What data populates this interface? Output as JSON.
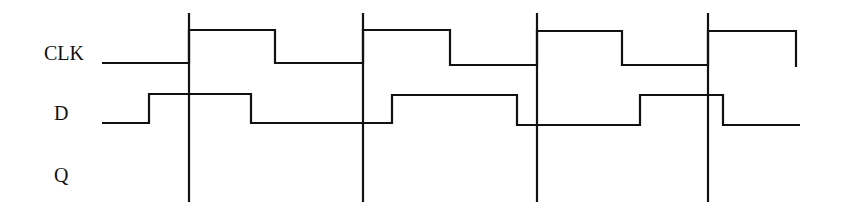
{
  "diagram": {
    "type": "timing-diagram",
    "signals": [
      {
        "name": "CLK",
        "label_pos": [
          44,
          60
        ]
      },
      {
        "name": "D",
        "label_pos": [
          54,
          120
        ]
      },
      {
        "name": "Q",
        "label_pos": [
          54,
          182
        ]
      }
    ],
    "clock_edges_x": [
      189,
      363,
      537,
      708
    ],
    "waveforms": {
      "CLK": "102,63 189,63 189,30 275,30 275,63 363,63 363,30 450,30 450,65 537,65 537,31 622,31 622,65 708,65 708,31 796,31 796,67",
      "D": "102,123 149,123 149,94 251,94 251,123 392,123 392,95 517,95 517,125 640,125 640,95 723,95 723,125 800,125",
      "Q": ""
    },
    "edge_line": {
      "y_top": 13,
      "y_bottom": 202
    }
  }
}
